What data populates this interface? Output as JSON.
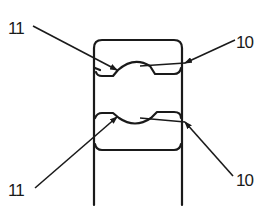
{
  "diagram": {
    "type": "ball-bearing-cross-section",
    "stroke_color": "#1a1a1a",
    "background": "#ffffff",
    "labels": [
      {
        "id": "upper-left",
        "text": "11",
        "x": 8,
        "y": 20,
        "target": "upper ball contact"
      },
      {
        "id": "upper-right",
        "text": "10",
        "x": 236,
        "y": 34,
        "target": "outer race"
      },
      {
        "id": "lower-left",
        "text": "11",
        "x": 8,
        "y": 182,
        "target": "lower ball contact"
      },
      {
        "id": "lower-right",
        "text": "10",
        "x": 236,
        "y": 172,
        "target": "inner race"
      }
    ]
  }
}
